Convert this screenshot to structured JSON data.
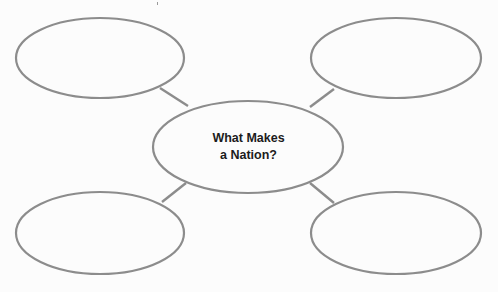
{
  "diagram": {
    "type": "concept-web",
    "stroke_color": "#8c8c8c",
    "background_color": "#fcfcfc",
    "text_color": "#1c1c1c",
    "center": {
      "label_line1": "What Makes",
      "label_line2": "a Nation?",
      "cx": 248,
      "cy": 147,
      "rx": 95,
      "ry": 46
    },
    "nodes": [
      {
        "id": "top-left",
        "label": "",
        "cx": 100,
        "cy": 58,
        "rx": 84,
        "ry": 40
      },
      {
        "id": "top-right",
        "label": "",
        "cx": 396,
        "cy": 58,
        "rx": 85,
        "ry": 40
      },
      {
        "id": "bottom-left",
        "label": "",
        "cx": 100,
        "cy": 233,
        "rx": 84,
        "ry": 41
      },
      {
        "id": "bottom-right",
        "label": "",
        "cx": 396,
        "cy": 233,
        "rx": 85,
        "ry": 41
      }
    ],
    "connectors": [
      {
        "from": "center",
        "to": "top-left",
        "x1": 188,
        "y1": 106,
        "x2": 160,
        "y2": 88
      },
      {
        "from": "center",
        "to": "top-right",
        "x1": 310,
        "y1": 107,
        "x2": 334,
        "y2": 89
      },
      {
        "from": "center",
        "to": "bottom-left",
        "x1": 186,
        "y1": 183,
        "x2": 162,
        "y2": 202
      },
      {
        "from": "center",
        "to": "bottom-right",
        "x1": 310,
        "y1": 183,
        "x2": 334,
        "y2": 203
      }
    ]
  }
}
